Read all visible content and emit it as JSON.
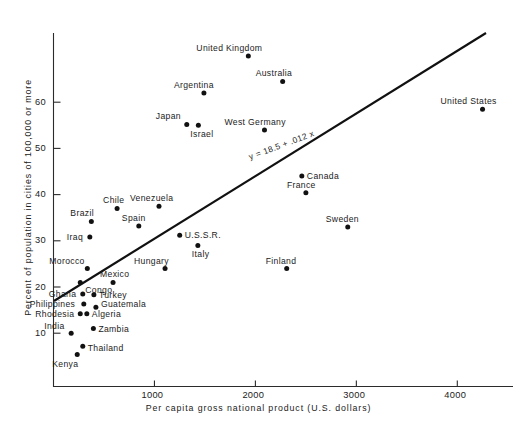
{
  "chart_data": {
    "type": "scatter",
    "title": "",
    "xlabel": "Per capita gross national product (U.S. dollars)",
    "ylabel": "Percent of population in cities of 100,000 or more",
    "xlim": [
      0,
      4400
    ],
    "ylim": [
      0,
      72
    ],
    "xticks": [
      1000,
      2000,
      3000,
      4000
    ],
    "yticks": [
      10,
      20,
      30,
      40,
      50,
      60
    ],
    "grid": false,
    "legend": "none",
    "annotations": [
      {
        "name": "regression-equation",
        "text": "y = 18.5 + .012 x"
      }
    ],
    "regression_line": {
      "intercept": 18.5,
      "slope": 0.012,
      "x_start": 20,
      "x_end": 4300
    },
    "points": [
      {
        "label": "United Kingdom",
        "x": 1930,
        "y": 70.0,
        "lx": -52,
        "ly": -12
      },
      {
        "label": "Australia",
        "x": 2270,
        "y": 64.5,
        "lx": -27,
        "ly": -12
      },
      {
        "label": "Argentina",
        "x": 1490,
        "y": 62.0,
        "lx": -30,
        "ly": -12
      },
      {
        "label": "United States",
        "x": 4250,
        "y": 58.5,
        "lx": -42,
        "ly": -12
      },
      {
        "label": "Japan",
        "x": 1320,
        "y": 55.2,
        "lx": -31,
        "ly": -12
      },
      {
        "label": "Israel",
        "x": 1435,
        "y": 55.0,
        "lx": -8,
        "ly": 5
      },
      {
        "label": "West Germany",
        "x": 2090,
        "y": 54.0,
        "lx": -40,
        "ly": -12
      },
      {
        "label": "Canada",
        "x": 2460,
        "y": 44.0,
        "lx": 5,
        "ly": -4
      },
      {
        "label": "France",
        "x": 2500,
        "y": 40.4,
        "lx": -19,
        "ly": -12
      },
      {
        "label": "Venezuela",
        "x": 1045,
        "y": 37.5,
        "lx": -29,
        "ly": -12
      },
      {
        "label": "Chile",
        "x": 630,
        "y": 37.0,
        "lx": -14,
        "ly": -12
      },
      {
        "label": "Brazil",
        "x": 375,
        "y": 34.2,
        "lx": -21,
        "ly": -12
      },
      {
        "label": "Spain",
        "x": 845,
        "y": 33.2,
        "lx": -17,
        "ly": -12
      },
      {
        "label": "Sweden",
        "x": 2915,
        "y": 33.0,
        "lx": -22,
        "ly": -12
      },
      {
        "label": "U.S.S.R.",
        "x": 1250,
        "y": 31.2,
        "lx": 5,
        "ly": -4
      },
      {
        "label": "Iraq",
        "x": 360,
        "y": 30.8,
        "lx": -23,
        "ly": -4
      },
      {
        "label": "Italy",
        "x": 1430,
        "y": 29.0,
        "lx": -6,
        "ly": 5
      },
      {
        "label": "Morocco",
        "x": 335,
        "y": 24.0,
        "lx": -38,
        "ly": -12
      },
      {
        "label": "Hungary",
        "x": 1105,
        "y": 24.0,
        "lx": -31,
        "ly": -12
      },
      {
        "label": "Finland",
        "x": 2310,
        "y": 24.0,
        "lx": -21,
        "ly": -12
      },
      {
        "label": "Congo",
        "x": 265,
        "y": 21.0,
        "lx": 5,
        "ly": 4
      },
      {
        "label": "Mexico",
        "x": 590,
        "y": 21.0,
        "lx": -13,
        "ly": -12
      },
      {
        "label": "Ghana",
        "x": 290,
        "y": 18.5,
        "lx": -34,
        "ly": -4
      },
      {
        "label": "Turkey",
        "x": 400,
        "y": 18.3,
        "lx": 5,
        "ly": -4
      },
      {
        "label": "Philippines",
        "x": 300,
        "y": 16.3,
        "lx": -54,
        "ly": -4
      },
      {
        "label": "Guatemala",
        "x": 420,
        "y": 15.6,
        "lx": 5,
        "ly": -7
      },
      {
        "label": "Rhodesia",
        "x": 265,
        "y": 14.2,
        "lx": -45,
        "ly": -4
      },
      {
        "label": "Algeria",
        "x": 330,
        "y": 14.2,
        "lx": 5,
        "ly": -4
      },
      {
        "label": "India",
        "x": 175,
        "y": 10.0,
        "lx": -27,
        "ly": -11
      },
      {
        "label": "Zambia",
        "x": 395,
        "y": 11.0,
        "lx": 5,
        "ly": -4
      },
      {
        "label": "Thailand",
        "x": 290,
        "y": 7.2,
        "lx": 5,
        "ly": -2
      },
      {
        "label": "Kenya",
        "x": 235,
        "y": 5.4,
        "lx": -25,
        "ly": 6
      }
    ]
  }
}
